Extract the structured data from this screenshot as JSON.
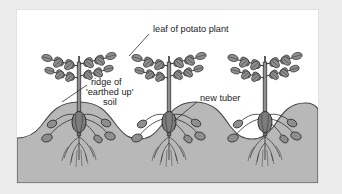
{
  "figure": {
    "panel_background": "#ffffff",
    "outer_background": "#ececec",
    "soil_color": "#b8b8b8",
    "soil_outline": "#4a4a4a",
    "plant_color": "#8a8a8a",
    "tuber_color": "#8e8e8e",
    "seed_potato_color": "#7d7d7d",
    "ink_color": "#1b1b1b"
  },
  "labels": {
    "leaf": "leaf of potato plant",
    "ridge_line1": "ridge of",
    "ridge_line2": "'earthed up'",
    "ridge_line3": "soil",
    "tuber": "new tuber"
  },
  "diagram_data": {
    "type": "diagram",
    "subject": "potato plant cultivation cross-section",
    "plant_count": 3,
    "plants": [
      {
        "index": 1,
        "stem_x": 62,
        "ridge_center": 62,
        "tubers": 5
      },
      {
        "index": 2,
        "stem_x": 152,
        "ridge_center": 152,
        "tubers": 5
      },
      {
        "index": 3,
        "stem_x": 248,
        "ridge_center": 248,
        "tubers": 5
      }
    ],
    "features": [
      "compound leaves with paired leaflets",
      "vertical stem",
      "ridge of earthed up soil",
      "seed potato at stem base",
      "stolons bearing new tubers",
      "fibrous root system"
    ],
    "annotations": [
      {
        "name": "leaf of potato plant",
        "leader_from": [
          148,
          33
        ],
        "leader_to": [
          128,
          56
        ]
      },
      {
        "name": "ridge of 'earthed up' soil",
        "leader_from": [
          85,
          84
        ],
        "leader_to": [
          60,
          100
        ]
      },
      {
        "name": "new tuber",
        "leader_from": [
          196,
          101
        ],
        "leader_to": [
          172,
          118
        ]
      }
    ]
  }
}
